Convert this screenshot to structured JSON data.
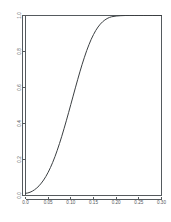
{
  "chart_data": {
    "type": "line",
    "title": "",
    "subtitle": "",
    "xlabel": "",
    "ylabel": "",
    "xlim": [
      0.0,
      0.3
    ],
    "ylim": [
      0.0,
      1.0
    ],
    "grid": false,
    "legend": null,
    "legend_position": "none",
    "background_color": "#ffffff",
    "line_color": "#3b3f42",
    "axis_color": "#555a5e",
    "x_ticks": [
      0.0,
      0.05,
      0.1,
      0.15,
      0.2,
      0.25,
      0.3
    ],
    "x_tick_labels": [
      "0.0",
      "0.05",
      "0.10",
      "0.15",
      "0.20",
      "0.25",
      "0.30"
    ],
    "y_ticks": [
      0.0,
      0.2,
      0.4,
      0.6,
      0.8,
      1.0
    ],
    "y_tick_labels": [
      "0.0",
      "0.2",
      "0.4",
      "0.6",
      "0.8",
      "1.0"
    ],
    "series": [
      {
        "name": "power",
        "x": [
          0.0,
          0.005,
          0.01,
          0.015,
          0.02,
          0.025,
          0.03,
          0.035,
          0.04,
          0.045,
          0.05,
          0.055,
          0.06,
          0.065,
          0.07,
          0.075,
          0.08,
          0.085,
          0.09,
          0.095,
          0.1,
          0.105,
          0.11,
          0.115,
          0.12,
          0.125,
          0.13,
          0.135,
          0.14,
          0.145,
          0.15,
          0.155,
          0.16,
          0.165,
          0.17,
          0.175,
          0.18,
          0.185,
          0.19,
          0.2,
          0.21,
          0.22,
          0.23,
          0.24,
          0.25,
          0.26,
          0.27,
          0.28,
          0.29,
          0.3
        ],
        "y": [
          0.012,
          0.014,
          0.018,
          0.024,
          0.032,
          0.042,
          0.054,
          0.069,
          0.086,
          0.106,
          0.129,
          0.155,
          0.184,
          0.216,
          0.251,
          0.289,
          0.329,
          0.371,
          0.415,
          0.46,
          0.506,
          0.552,
          0.598,
          0.643,
          0.687,
          0.729,
          0.768,
          0.805,
          0.838,
          0.868,
          0.894,
          0.917,
          0.936,
          0.952,
          0.965,
          0.975,
          0.983,
          0.989,
          0.993,
          0.997,
          0.999,
          1.0,
          1.0,
          1.0,
          1.0,
          1.0,
          1.0,
          1.0,
          1.0,
          1.0
        ]
      }
    ]
  }
}
